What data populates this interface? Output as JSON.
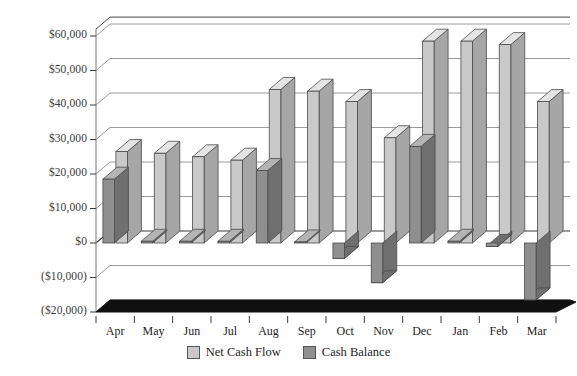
{
  "chart_data": {
    "type": "bar",
    "title": "",
    "subtitle": "",
    "xlabel": "",
    "ylabel": "",
    "categories": [
      "Apr",
      "May",
      "Jun",
      "Jul",
      "Aug",
      "Sep",
      "Oct",
      "Nov",
      "Dec",
      "Jan",
      "Feb",
      "Mar"
    ],
    "ytick_labels": [
      "$60,000",
      "$50,000",
      "$40,000",
      "$30,000",
      "$20,000",
      "$10,000",
      "$0",
      "($10,000)",
      "($20,000)"
    ],
    "ytick_values": [
      60000,
      50000,
      40000,
      30000,
      20000,
      10000,
      0,
      -10000,
      -20000
    ],
    "ylim": [
      -20000,
      62000
    ],
    "grid": true,
    "legend_position": "bottom-center",
    "style": "3d-columns",
    "series": [
      {
        "name": "Net Cash Flow",
        "color": "#c9c9c9",
        "side_color": "#a6a6a6",
        "top_color": "#e4e4e4",
        "values": [
          26500,
          26000,
          25000,
          24000,
          44500,
          44000,
          41000,
          30500,
          58500,
          58500,
          57500,
          41000
        ]
      },
      {
        "name": "Cash Balance",
        "color": "#8f8f8f",
        "side_color": "#6f6f6f",
        "top_color": "#b4b4b4",
        "values": [
          18500,
          500,
          500,
          500,
          21000,
          300,
          -4500,
          -11500,
          28000,
          500,
          -1000,
          -16500
        ]
      }
    ]
  },
  "legend": {
    "items": [
      {
        "label": "Net Cash Flow"
      },
      {
        "label": "Cash Balance"
      }
    ]
  }
}
